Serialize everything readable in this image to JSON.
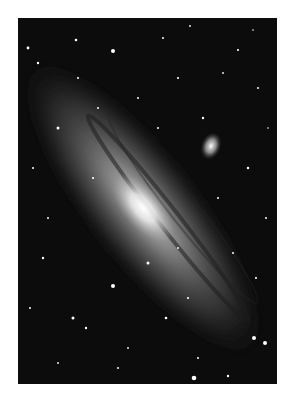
{
  "image": {
    "subject": "Andromeda Galaxy",
    "colors": {
      "background": "#ffffff",
      "sky": "#0c0c0c",
      "core": "#f4f4f4",
      "disk": "#8a8a8a"
    }
  }
}
